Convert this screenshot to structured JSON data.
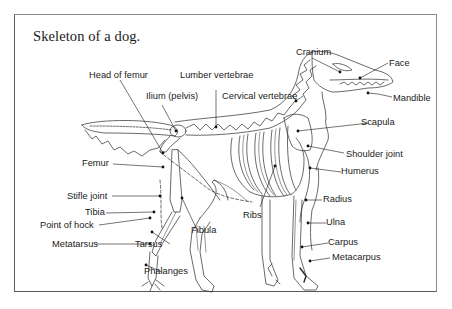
{
  "figure": {
    "title": "Skeleton of a dog."
  },
  "labels": {
    "cranium": "Cranium",
    "face": "Face",
    "mandible": "Mandible",
    "head_of_femur": "Head of femur",
    "lumber_vertebrae": "Lumber vertebrae",
    "ilium_pelvis": "Ilium (pelvis)",
    "cervical_vertebrae": "Cervical vertebrae",
    "scapula": "Scapula",
    "shoulder_joint": "Shoulder joint",
    "humerus": "Humerus",
    "femur": "Femur",
    "radius": "Radius",
    "stifle_joint": "Stifle joint",
    "ribs": "Ribs",
    "ulna": "Ulna",
    "tibia": "Tibia",
    "fibula": "Fibula",
    "point_of_hock": "Point of hock",
    "carpus": "Carpus",
    "metatarsus": "Metatarsus",
    "tarsus": "Tarsus",
    "metacarpus": "Metacarpus",
    "phalanges": "Phalanges"
  },
  "colors": {
    "line": "#2a2a2a",
    "text": "#222222",
    "frame": "#5a5a5a"
  }
}
